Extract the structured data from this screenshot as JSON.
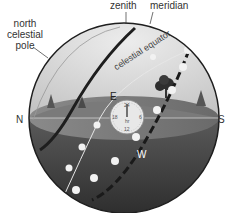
{
  "diagram": {
    "type": "celestial-sphere",
    "labels": {
      "north_celestial_pole_line1": "north",
      "north_celestial_pole_line2": "celestial",
      "north_celestial_pole_line3": "pole",
      "zenith": "zenith",
      "meridian": "meridian",
      "celestial_equator": "celestial equator",
      "north": "N",
      "south": "S",
      "east": "E",
      "west": "W"
    },
    "dial": {
      "top": "24",
      "left": "18",
      "right": "6",
      "bottom": "12",
      "center": "hr"
    },
    "colors": {
      "sky": "#d9d9d9",
      "ground": "#6e6e6e",
      "lower_hemisphere": "#3c3c3c",
      "outline": "#1e1e1e",
      "equator_dots": "#f2f2f2"
    }
  }
}
